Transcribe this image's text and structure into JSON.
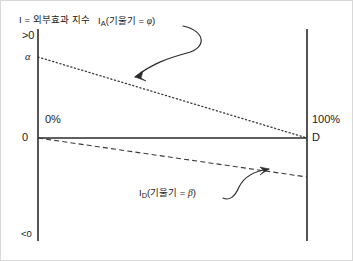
{
  "diagram": {
    "type": "line",
    "axis_title": "I = 외부효과 지수",
    "labels": {
      "positive_region": ">0",
      "negative_region": "<0",
      "intercept_alpha": "α",
      "origin": "0",
      "left_pct": "0%",
      "right_pct": "100%",
      "right_point": "D"
    },
    "annotations": [
      {
        "name": "ia-annotation",
        "prefix": "I",
        "subscript": "A",
        "body": "(기울기 = ",
        "symbol": "φ",
        "suffix": ")"
      },
      {
        "name": "id-annotation",
        "prefix": "I",
        "subscript": "D",
        "body": "(기울기 = ",
        "symbol": "β",
        "suffix": ")"
      }
    ],
    "geometry": {
      "left_axis_x": 37,
      "right_axis_x": 306,
      "axis_top_y": 28,
      "axis_bottom_y": 240,
      "baseline_y": 137,
      "alpha_y": 56,
      "ia_start": [
        37,
        56
      ],
      "ia_end": [
        306,
        137
      ],
      "id_start": [
        37,
        137
      ],
      "id_end": [
        306,
        176
      ]
    },
    "colors": {
      "ink": "#1b1b1b",
      "line": "#4a4a4a",
      "background": "#ffffff",
      "border": "#d8d8d8"
    }
  }
}
